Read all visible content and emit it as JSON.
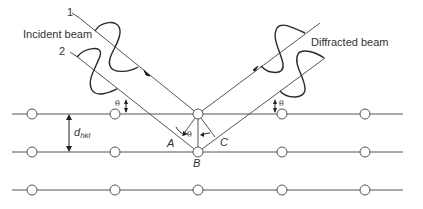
{
  "labels": {
    "incident_beam": "Incident beam",
    "diffracted_beam": "Diffracted beam",
    "ray_1": "1",
    "ray_2": "2",
    "theta": "θ",
    "point_a": "A",
    "point_b": "B",
    "point_c": "C",
    "d_main": "d",
    "d_sub": "hkl"
  },
  "lattice": {
    "plane_y": [
      114,
      152,
      190
    ],
    "atom_x": [
      32,
      115,
      198,
      282,
      365
    ],
    "line_x_start": 12,
    "line_x_end": 403,
    "atom_radius": 5
  },
  "colors": {
    "line": "#555555",
    "wave": "#2a2a2a",
    "text": "#333333",
    "background": "#ffffff"
  }
}
